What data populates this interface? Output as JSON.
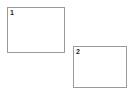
{
  "canvas": {
    "width": 132,
    "height": 94,
    "background_color": "#ffffff"
  },
  "style": {
    "box_border_color": "#9a9a9a",
    "box_fill_color": "#ffffff",
    "label_color": "#1c1c1c"
  },
  "regions": [
    {
      "id": "region-1",
      "label": "1",
      "x": 7,
      "y": 7,
      "width": 58,
      "height": 46
    },
    {
      "id": "region-2",
      "label": "2",
      "x": 73,
      "y": 46,
      "width": 54,
      "height": 42
    }
  ]
}
